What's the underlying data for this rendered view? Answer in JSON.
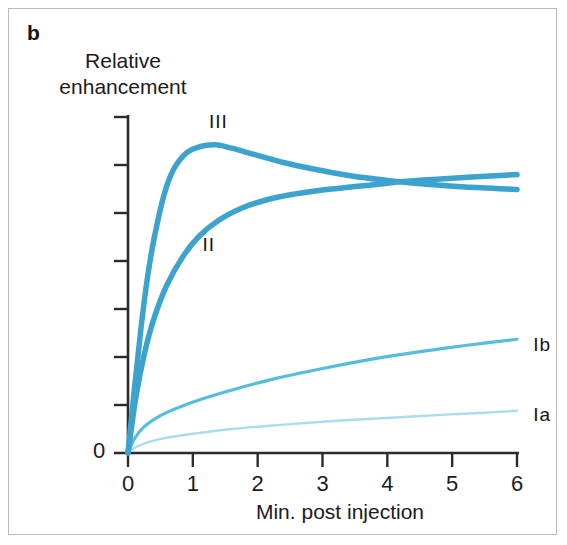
{
  "figure": {
    "panel_letter": "b",
    "border_color": "#b9b9b9",
    "background": "#ffffff"
  },
  "chart_data": {
    "type": "line",
    "title": "",
    "subtitle": "",
    "xlabel": "Min. post injection",
    "ylabel_lines": [
      "Relative",
      "enhancement"
    ],
    "ylabel": "Relative enhancement",
    "xlim": [
      0,
      6
    ],
    "ylim": [
      0,
      7
    ],
    "x_ticks": [
      0,
      1,
      2,
      3,
      4,
      5,
      6
    ],
    "x_tick_labels": [
      "0",
      "1",
      "2",
      "3",
      "4",
      "5",
      "6"
    ],
    "y_tick_values": [
      0,
      1,
      2,
      3,
      4,
      5,
      6,
      7
    ],
    "y_tick_labels": [
      "0",
      "",
      "",
      "",
      "",
      "",
      "",
      ""
    ],
    "y_axis_origin_label": "0",
    "grid": false,
    "legend": "inline-annotations",
    "series": [
      {
        "name": "III",
        "label": "III",
        "color": "#3ba3cd",
        "width": 5.5,
        "label_pos": {
          "x": 1.25,
          "y": 7.1
        },
        "points": [
          [
            0.0,
            0.0
          ],
          [
            0.1,
            1.35
          ],
          [
            0.2,
            2.6
          ],
          [
            0.3,
            3.65
          ],
          [
            0.4,
            4.45
          ],
          [
            0.55,
            5.35
          ],
          [
            0.7,
            5.9
          ],
          [
            0.9,
            6.25
          ],
          [
            1.1,
            6.38
          ],
          [
            1.35,
            6.42
          ],
          [
            1.6,
            6.35
          ],
          [
            2.0,
            6.2
          ],
          [
            2.5,
            6.02
          ],
          [
            3.0,
            5.88
          ],
          [
            3.5,
            5.76
          ],
          [
            4.0,
            5.68
          ],
          [
            4.2,
            5.65
          ],
          [
            4.6,
            5.6
          ],
          [
            5.2,
            5.54
          ],
          [
            6.0,
            5.49
          ]
        ]
      },
      {
        "name": "II",
        "label": "II",
        "color": "#3ba3cd",
        "width": 5.5,
        "label_pos": {
          "x": 1.15,
          "y": 4.55
        },
        "points": [
          [
            0.0,
            0.0
          ],
          [
            0.12,
            1.15
          ],
          [
            0.25,
            2.05
          ],
          [
            0.4,
            2.8
          ],
          [
            0.6,
            3.5
          ],
          [
            0.85,
            4.1
          ],
          [
            1.1,
            4.52
          ],
          [
            1.4,
            4.85
          ],
          [
            1.75,
            5.1
          ],
          [
            2.1,
            5.26
          ],
          [
            2.5,
            5.38
          ],
          [
            3.0,
            5.48
          ],
          [
            3.5,
            5.55
          ],
          [
            4.0,
            5.62
          ],
          [
            4.2,
            5.65
          ],
          [
            4.7,
            5.7
          ],
          [
            5.3,
            5.75
          ],
          [
            6.0,
            5.8
          ]
        ]
      },
      {
        "name": "Ib",
        "label": "Ib",
        "color": "#58bcdc",
        "width": 3.2,
        "label_pos": {
          "x": 6.25,
          "y": 2.45
        },
        "points": [
          [
            0.0,
            0.0
          ],
          [
            0.1,
            0.3
          ],
          [
            0.25,
            0.55
          ],
          [
            0.5,
            0.78
          ],
          [
            0.8,
            0.96
          ],
          [
            1.2,
            1.15
          ],
          [
            1.7,
            1.35
          ],
          [
            2.3,
            1.56
          ],
          [
            3.0,
            1.76
          ],
          [
            3.7,
            1.94
          ],
          [
            4.4,
            2.09
          ],
          [
            5.2,
            2.24
          ],
          [
            6.0,
            2.37
          ]
        ]
      },
      {
        "name": "Ia",
        "label": "Ia",
        "color": "#a9dced",
        "width": 2.4,
        "label_pos": {
          "x": 6.25,
          "y": 1.0
        },
        "points": [
          [
            0.0,
            0.0
          ],
          [
            0.12,
            0.12
          ],
          [
            0.3,
            0.22
          ],
          [
            0.6,
            0.32
          ],
          [
            1.0,
            0.4
          ],
          [
            1.6,
            0.5
          ],
          [
            2.3,
            0.58
          ],
          [
            3.1,
            0.66
          ],
          [
            4.0,
            0.73
          ],
          [
            4.9,
            0.8
          ],
          [
            5.5,
            0.84
          ],
          [
            6.0,
            0.88
          ]
        ]
      }
    ],
    "annotations": [
      {
        "text": "III",
        "series": "III"
      },
      {
        "text": "II",
        "series": "II"
      },
      {
        "text": "Ib",
        "series": "Ib"
      },
      {
        "text": "Ia",
        "series": "Ia"
      }
    ],
    "axis_color": "#2b2b2b"
  }
}
